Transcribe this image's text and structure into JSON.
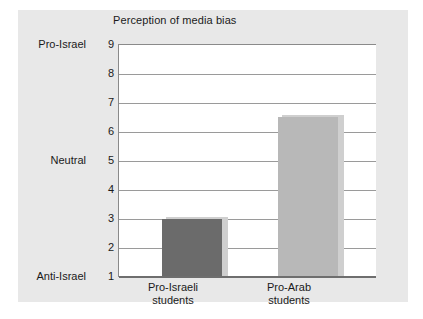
{
  "chart_data": {
    "type": "bar",
    "title": "Perception of media bias",
    "xlabel": "",
    "ylabel": "",
    "categories": [
      "Pro-Israeli students",
      "Pro-Arab students"
    ],
    "category_lines": [
      [
        "Pro-Israeli",
        "students"
      ],
      [
        "Pro-Arab",
        "students"
      ]
    ],
    "values": [
      3.0,
      6.5
    ],
    "ylim": [
      1,
      9
    ],
    "yticks": [
      1,
      2,
      3,
      4,
      5,
      6,
      7,
      8,
      9
    ],
    "ytick_labels": [
      "1",
      "2",
      "3",
      "4",
      "5",
      "6",
      "7",
      "8",
      "9"
    ],
    "y_category_labels": [
      {
        "value": 9,
        "label": "Pro-Israel"
      },
      {
        "value": 5,
        "label": "Neutral"
      },
      {
        "value": 1,
        "label": "Anti-Israel"
      }
    ],
    "bar_colors": [
      "#6b6b6b",
      "#b8b8b8"
    ],
    "grid": true,
    "legend": "none",
    "background_color": "#e8e8e8",
    "plot_background_color": "#ffffff",
    "gridline_color": "#9a9a9a",
    "axis_color": "#6e6e6e",
    "text_color": "#1a1a1a"
  }
}
